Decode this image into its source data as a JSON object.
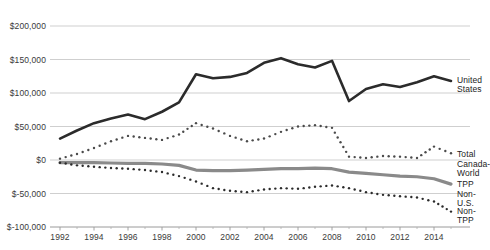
{
  "chart_data": {
    "type": "line",
    "title": "",
    "subtitle": "",
    "xlabel": "",
    "ylabel": "",
    "grid": true,
    "legend_position": "right-inline",
    "xlim": [
      1992,
      2015
    ],
    "ylim": [
      -100000,
      200000
    ],
    "y_ticks": [
      200000,
      150000,
      100000,
      50000,
      0,
      -50000,
      -100000
    ],
    "y_tick_labels": [
      "$200,000",
      "$150,000",
      "$100,000",
      "$50,000",
      "$0",
      "$-50,000",
      "$-100,000"
    ],
    "x_ticks": [
      1992,
      1994,
      1996,
      1998,
      2000,
      2002,
      2004,
      2006,
      2008,
      2010,
      2012,
      2014
    ],
    "x_tick_labels": [
      "1992",
      "1994",
      "1996",
      "1998",
      "2000",
      "2002",
      "2004",
      "2006",
      "2008",
      "2010",
      "2012",
      "2014"
    ],
    "x": [
      1992,
      1993,
      1994,
      1995,
      1996,
      1997,
      1998,
      1999,
      2000,
      2001,
      2002,
      2003,
      2004,
      2005,
      2006,
      2007,
      2008,
      2009,
      2010,
      2011,
      2012,
      2013,
      2014,
      2015
    ],
    "series": [
      {
        "name": "United States",
        "style": "solid",
        "color": "#2b2b2b",
        "width": 2.6,
        "label_text": "United States",
        "values": [
          32000,
          44000,
          55000,
          62000,
          68000,
          61000,
          72000,
          86000,
          128000,
          122000,
          124000,
          130000,
          145000,
          152000,
          143000,
          138000,
          148000,
          88000,
          106000,
          113000,
          109000,
          116000,
          125000,
          118000
        ]
      },
      {
        "name": "Total Canada-World",
        "style": "dotted",
        "color": "#4a4a4a",
        "width": 2.4,
        "label_text": "Total Canada-\nWorld",
        "values": [
          2000,
          9000,
          18000,
          28000,
          36000,
          33000,
          30000,
          38000,
          55000,
          47000,
          36000,
          28000,
          32000,
          42000,
          50000,
          52000,
          48000,
          5000,
          3000,
          6000,
          5000,
          3000,
          20000,
          10000
        ]
      },
      {
        "name": "TPP Non-U.S.",
        "style": "solid",
        "color": "#8a8a8a",
        "width": 3.2,
        "label_text": "TPP Non-U.S.",
        "values": [
          -4000,
          -4000,
          -4000,
          -4500,
          -5000,
          -5000,
          -6000,
          -8000,
          -15000,
          -16000,
          -16000,
          -15000,
          -14000,
          -13000,
          -13000,
          -12000,
          -13000,
          -18000,
          -20000,
          -22000,
          -24000,
          -25000,
          -28000,
          -36000
        ]
      },
      {
        "name": "Non-TPP",
        "style": "dotted",
        "color": "#2b2b2b",
        "width": 2.4,
        "label_text": "Non-TPP",
        "values": [
          -4000,
          -8000,
          -10000,
          -12000,
          -13000,
          -15000,
          -18000,
          -24000,
          -32000,
          -42000,
          -46000,
          -48000,
          -44000,
          -42000,
          -43000,
          -40000,
          -38000,
          -42000,
          -48000,
          -52000,
          -54000,
          -56000,
          -62000,
          -77000
        ]
      }
    ]
  }
}
